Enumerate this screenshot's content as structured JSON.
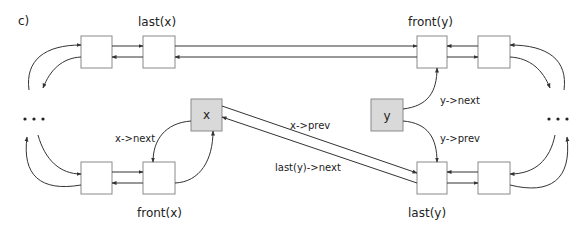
{
  "figure": {
    "panel_label": "c)",
    "colors": {
      "node_fill": "#ffffff",
      "highlight_fill": "#d9d9d9",
      "stroke": "#8a8a8a",
      "edge": "#333333"
    },
    "node_labels": {
      "x": "x",
      "y": "y"
    },
    "captions": {
      "last_x": "last(x)",
      "front_y": "front(y)",
      "front_x": "front(x)",
      "last_y": "last(y)"
    },
    "edge_labels": {
      "x_next": "x->next",
      "x_prev": "x->prev",
      "last_y_next": "last(y)->next",
      "y_next": "y->next",
      "y_prev": "y->prev"
    },
    "ellipsis_left": "...",
    "ellipsis_right": "..."
  }
}
